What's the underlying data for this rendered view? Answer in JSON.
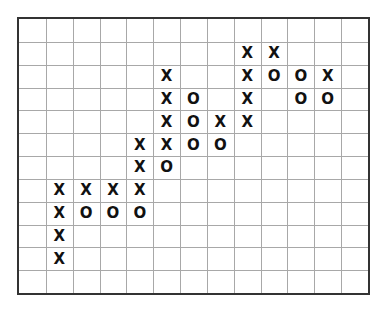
{
  "chart_data": {
    "type": "point-and-figure",
    "title": "",
    "xlabel": "",
    "ylabel": "",
    "grid": true,
    "columns": 13,
    "rows": 12,
    "cells": [
      {
        "row": 1,
        "col": 8,
        "mark": "X"
      },
      {
        "row": 1,
        "col": 9,
        "mark": "X"
      },
      {
        "row": 2,
        "col": 5,
        "mark": "X"
      },
      {
        "row": 2,
        "col": 8,
        "mark": "X"
      },
      {
        "row": 2,
        "col": 9,
        "mark": "O"
      },
      {
        "row": 2,
        "col": 10,
        "mark": "O"
      },
      {
        "row": 2,
        "col": 11,
        "mark": "X"
      },
      {
        "row": 3,
        "col": 5,
        "mark": "X"
      },
      {
        "row": 3,
        "col": 6,
        "mark": "O"
      },
      {
        "row": 3,
        "col": 8,
        "mark": "X"
      },
      {
        "row": 3,
        "col": 10,
        "mark": "O"
      },
      {
        "row": 3,
        "col": 11,
        "mark": "O"
      },
      {
        "row": 4,
        "col": 5,
        "mark": "X"
      },
      {
        "row": 4,
        "col": 6,
        "mark": "O"
      },
      {
        "row": 4,
        "col": 7,
        "mark": "X"
      },
      {
        "row": 4,
        "col": 8,
        "mark": "X"
      },
      {
        "row": 5,
        "col": 4,
        "mark": "X"
      },
      {
        "row": 5,
        "col": 5,
        "mark": "X"
      },
      {
        "row": 5,
        "col": 6,
        "mark": "O"
      },
      {
        "row": 5,
        "col": 7,
        "mark": "O"
      },
      {
        "row": 6,
        "col": 4,
        "mark": "X"
      },
      {
        "row": 6,
        "col": 5,
        "mark": "O"
      },
      {
        "row": 7,
        "col": 1,
        "mark": "X"
      },
      {
        "row": 7,
        "col": 2,
        "mark": "X"
      },
      {
        "row": 7,
        "col": 3,
        "mark": "X"
      },
      {
        "row": 7,
        "col": 4,
        "mark": "X"
      },
      {
        "row": 8,
        "col": 1,
        "mark": "X"
      },
      {
        "row": 8,
        "col": 2,
        "mark": "O"
      },
      {
        "row": 8,
        "col": 3,
        "mark": "O"
      },
      {
        "row": 8,
        "col": 4,
        "mark": "O"
      },
      {
        "row": 9,
        "col": 1,
        "mark": "X"
      },
      {
        "row": 10,
        "col": 1,
        "mark": "X"
      }
    ],
    "colors": {
      "frame": "#333333",
      "grid": "#a8a8a8",
      "mark": "#111111"
    }
  }
}
